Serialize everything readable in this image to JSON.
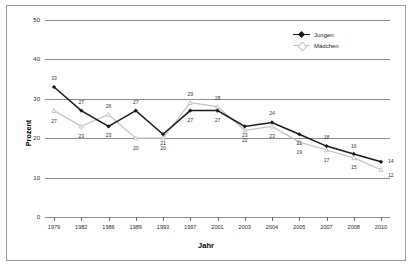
{
  "chart_data": {
    "type": "line",
    "title": "",
    "xlabel": "Jahr",
    "ylabel": "Prozent",
    "categories": [
      "1979",
      "1982",
      "1986",
      "1989",
      "1993",
      "1997",
      "2001",
      "2003",
      "2004",
      "2005",
      "2007",
      "2008",
      "2010"
    ],
    "ylim": [
      0,
      50
    ],
    "yticks": [
      0,
      10,
      20,
      30,
      40,
      50
    ],
    "grid": true,
    "legend_position": "top-right",
    "series": [
      {
        "name": "Jungen",
        "color": "#1a1a1a",
        "marker": "filled-diamond",
        "values": [
          33,
          27,
          23,
          27,
          21,
          27,
          27,
          23,
          24,
          21,
          18,
          16,
          14
        ],
        "label_offsets_y": [
          -9,
          -9,
          9,
          -9,
          9,
          9,
          9,
          9,
          -9,
          9,
          -9,
          -8,
          0
        ]
      },
      {
        "name": "Mädchen",
        "color": "#c2c2c2",
        "marker": "open-triangle",
        "values": [
          27,
          23,
          26,
          20,
          20,
          29,
          28,
          22,
          23,
          19,
          17,
          15,
          12
        ],
        "label_offsets_y": [
          10,
          10,
          -9,
          10,
          10,
          -9,
          -9,
          10,
          10,
          10,
          10,
          9,
          0
        ]
      }
    ]
  },
  "legend": {
    "entries": [
      {
        "label": "Jungen"
      },
      {
        "label": "Mädchen"
      }
    ]
  },
  "axes": {
    "y_title": "Prozent",
    "x_title": "Jahr",
    "y_tick_labels": [
      "0",
      "10",
      "20",
      "30",
      "40",
      "50"
    ],
    "x_tick_labels": [
      "1979",
      "1982",
      "1986",
      "1989",
      "1993",
      "1997",
      "2001",
      "2003",
      "2004",
      "2005",
      "2007",
      "2008",
      "2010"
    ]
  },
  "colors": {
    "jungen": "#1a1a1a",
    "maedchen": "#c2c2c2",
    "grid": "#8c8c8c",
    "border": "#9a9a9a",
    "text": "#2b2b2b"
  }
}
